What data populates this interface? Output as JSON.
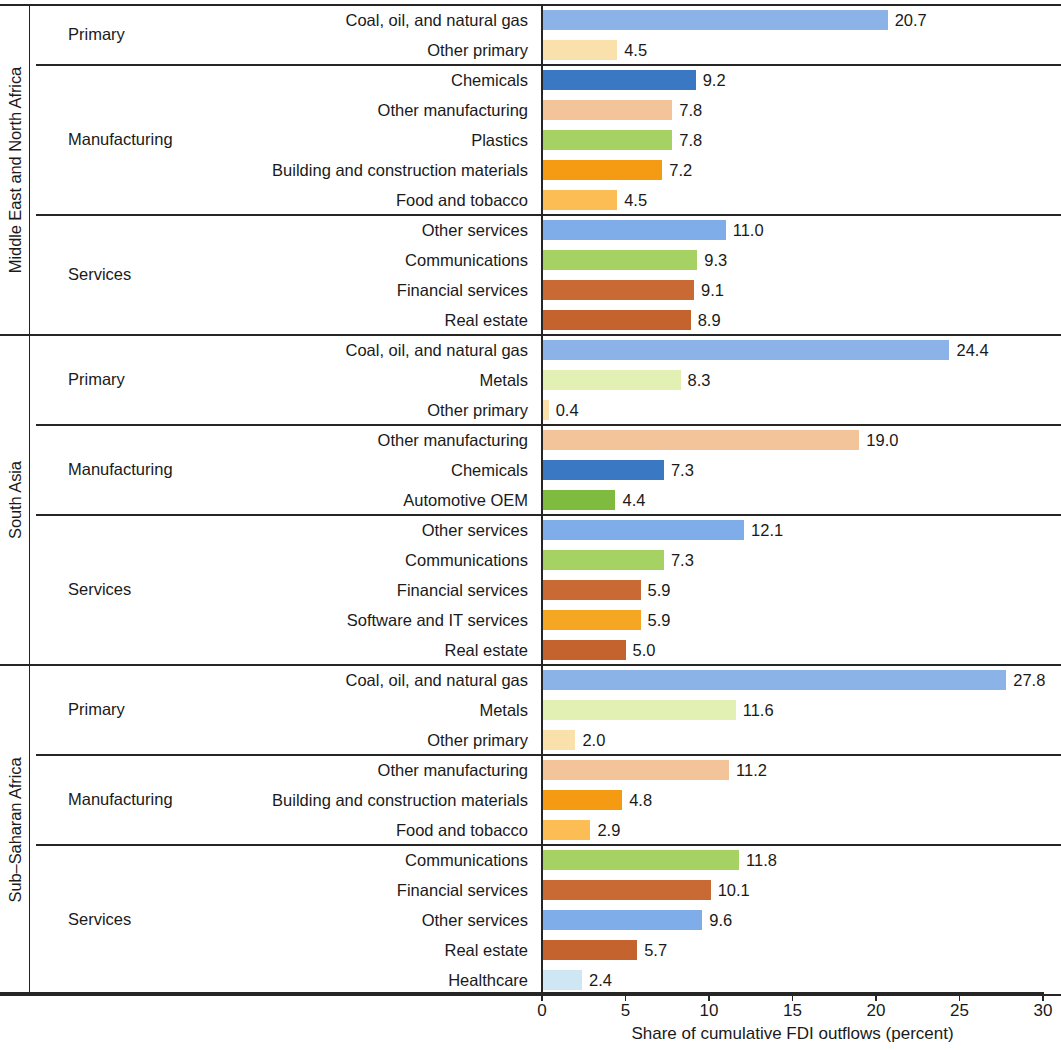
{
  "chart_data": {
    "type": "bar",
    "orientation": "horizontal",
    "title": "",
    "xlabel": "Share of cumulative FDI outflows (percent)",
    "ylabel": "",
    "xlim": [
      0,
      30
    ],
    "xticks": [
      0,
      5,
      10,
      15,
      20,
      25,
      30
    ],
    "xtick_labels": [
      "0",
      "5",
      "10",
      "15",
      "20",
      "25",
      "30"
    ],
    "grid": false,
    "legend": "none",
    "regions": [
      {
        "region": "Middle East and North Africa",
        "groups": [
          {
            "group": "Primary",
            "bars": [
              {
                "category": "Coal, oil, and natural gas",
                "value": 20.7,
                "label": "20.7",
                "color": "#8cb3e8"
              },
              {
                "category": "Other primary",
                "value": 4.5,
                "label": "4.5",
                "color": "#fae0ab"
              }
            ]
          },
          {
            "group": "Manufacturing",
            "bars": [
              {
                "category": "Chemicals",
                "value": 9.2,
                "label": "9.2",
                "color": "#3b78c3"
              },
              {
                "category": "Other manufacturing",
                "value": 7.8,
                "label": "7.8",
                "color": "#f3c39a"
              },
              {
                "category": "Plastics",
                "value": 7.8,
                "label": "7.8",
                "color": "#a6d263"
              },
              {
                "category": "Building and construction materials",
                "value": 7.2,
                "label": "7.2",
                "color": "#f59b13"
              },
              {
                "category": "Food and tobacco",
                "value": 4.5,
                "label": "4.5",
                "color": "#fbbd54"
              }
            ]
          },
          {
            "group": "Services",
            "bars": [
              {
                "category": "Other services",
                "value": 11.0,
                "label": "11.0",
                "color": "#7fadea"
              },
              {
                "category": "Communications",
                "value": 9.3,
                "label": "9.3",
                "color": "#a6d263"
              },
              {
                "category": "Financial services",
                "value": 9.1,
                "label": "9.1",
                "color": "#c96a35"
              },
              {
                "category": "Real estate",
                "value": 8.9,
                "label": "8.9",
                "color": "#c5632e"
              }
            ]
          }
        ]
      },
      {
        "region": "South Asia",
        "groups": [
          {
            "group": "Primary",
            "bars": [
              {
                "category": "Coal, oil, and natural gas",
                "value": 24.4,
                "label": "24.4",
                "color": "#8cb3e8"
              },
              {
                "category": "Metals",
                "value": 8.3,
                "label": "8.3",
                "color": "#e3f0b4"
              },
              {
                "category": "Other primary",
                "value": 0.4,
                "label": "0.4",
                "color": "#fae0ab"
              }
            ]
          },
          {
            "group": "Manufacturing",
            "bars": [
              {
                "category": "Other manufacturing",
                "value": 19.0,
                "label": "19.0",
                "color": "#f3c39a"
              },
              {
                "category": "Chemicals",
                "value": 7.3,
                "label": "7.3",
                "color": "#3b78c3"
              },
              {
                "category": "Automotive OEM",
                "value": 4.4,
                "label": "4.4",
                "color": "#7fbb3f"
              }
            ]
          },
          {
            "group": "Services",
            "bars": [
              {
                "category": "Other services",
                "value": 12.1,
                "label": "12.1",
                "color": "#7fadea"
              },
              {
                "category": "Communications",
                "value": 7.3,
                "label": "7.3",
                "color": "#a6d263"
              },
              {
                "category": "Financial services",
                "value": 5.9,
                "label": "5.9",
                "color": "#c96a35"
              },
              {
                "category": "Software and IT services",
                "value": 5.9,
                "label": "5.9",
                "color": "#f5a623"
              },
              {
                "category": "Real estate",
                "value": 5.0,
                "label": "5.0",
                "color": "#c5632e"
              }
            ]
          }
        ]
      },
      {
        "region": "Sub–Saharan Africa",
        "groups": [
          {
            "group": "Primary",
            "bars": [
              {
                "category": "Coal, oil, and natural gas",
                "value": 27.8,
                "label": "27.8",
                "color": "#8cb3e8"
              },
              {
                "category": "Metals",
                "value": 11.6,
                "label": "11.6",
                "color": "#e3f0b4"
              },
              {
                "category": "Other primary",
                "value": 2.0,
                "label": "2.0",
                "color": "#fae0ab"
              }
            ]
          },
          {
            "group": "Manufacturing",
            "bars": [
              {
                "category": "Other manufacturing",
                "value": 11.2,
                "label": "11.2",
                "color": "#f3c39a"
              },
              {
                "category": "Building and construction materials",
                "value": 4.8,
                "label": "4.8",
                "color": "#f59b13"
              },
              {
                "category": "Food and tobacco",
                "value": 2.9,
                "label": "2.9",
                "color": "#fbbd54"
              }
            ]
          },
          {
            "group": "Services",
            "bars": [
              {
                "category": "Communications",
                "value": 11.8,
                "label": "11.8",
                "color": "#a6d263"
              },
              {
                "category": "Financial services",
                "value": 10.1,
                "label": "10.1",
                "color": "#c96a35"
              },
              {
                "category": "Other services",
                "value": 9.6,
                "label": "9.6",
                "color": "#7fadea"
              },
              {
                "category": "Real estate",
                "value": 5.7,
                "label": "5.7",
                "color": "#c5632e"
              },
              {
                "category": "Healthcare",
                "value": 2.4,
                "label": "2.4",
                "color": "#cfe6f5"
              }
            ]
          }
        ]
      }
    ]
  }
}
